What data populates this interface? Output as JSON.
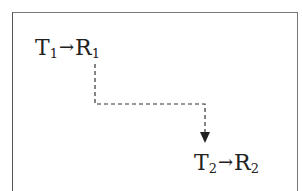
{
  "diagram": {
    "nodes": [
      {
        "id": "n1",
        "main_left": "T",
        "sub_left": "1",
        "arrow": "→",
        "main_right": "R",
        "sub_right": "1"
      },
      {
        "id": "n2",
        "main_left": "T",
        "sub_left": "2",
        "arrow": "→",
        "main_right": "R",
        "sub_right": "2"
      }
    ],
    "edges": [
      {
        "from": "n1",
        "to": "n2",
        "style": "dashed",
        "arrowhead": "down"
      }
    ],
    "colors": {
      "line": "#333333",
      "frame": "#777777",
      "text": "#222222"
    }
  }
}
